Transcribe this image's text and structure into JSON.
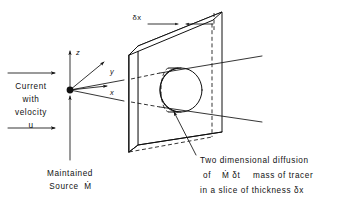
{
  "figure": {
    "domain": "Diagram",
    "type": "technical-line-diagram",
    "background_color": "#ffffff",
    "line_color": "#111111"
  },
  "labels": {
    "current_line1": "Current",
    "current_line2": "with",
    "current_line3": "velocity",
    "current_line4": "u",
    "source_line1": "Maintained",
    "source_line2": "Source",
    "source_symbol": "Ṁ",
    "thickness_dimension": "δx"
  },
  "axes": {
    "z": "z",
    "y": "y",
    "x": "x"
  },
  "caption": {
    "line1": "Two dimensional diffusion",
    "line2_prefix": "of",
    "line2_symbol": "Ṁ δt",
    "line2_suffix": "mass of tracer",
    "line3": "in a slice of thickness δx"
  },
  "icons": {
    "current_arrow_top": "right-arrow-icon",
    "current_arrow_bottom": "right-arrow-icon",
    "source_leader": "up-arrow-icon",
    "axis_z": "up-arrow-icon",
    "axis_y": "diagonal-arrow-icon",
    "axis_x": "right-arrow-icon",
    "dimension_arrow_left": "right-arrow-icon",
    "dimension_arrow_right": "left-arrow-icon",
    "caption_leader": "leader-arrow-icon",
    "origin_point": "filled-dot-icon"
  },
  "geometry": {
    "origin": {
      "x": 70,
      "y": 90
    },
    "slab": {
      "front_face": [
        [
          129,
          55
        ],
        [
          129,
          152
        ],
        [
          152,
          167
        ],
        [
          152,
          43
        ]
      ],
      "back_face": [
        [
          138,
          46
        ],
        [
          138,
          145
        ],
        [
          222,
          132
        ],
        [
          222,
          12
        ]
      ],
      "thickness_label_position": [
        137,
        19
      ]
    },
    "tracer_disk": {
      "front_ellipse": {
        "cx": 181,
        "cy": 90,
        "rx": 21,
        "ry": 22
      },
      "back_ellipse": {
        "cx": 169,
        "cy": 90,
        "rx": 8,
        "ry": 22
      }
    },
    "cone_upper": [
      [
        70,
        90
      ],
      [
        262,
        58
      ]
    ],
    "cone_lower": [
      [
        70,
        90
      ],
      [
        262,
        120
      ]
    ]
  }
}
